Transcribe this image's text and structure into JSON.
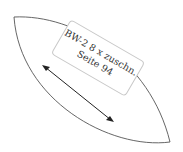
{
  "pattern_piece": {
    "label_line1": "BW-2 8 x zuschn.",
    "label_line2": "Seite 94",
    "outline_color": "#555555",
    "arrow_color": "#222222"
  }
}
